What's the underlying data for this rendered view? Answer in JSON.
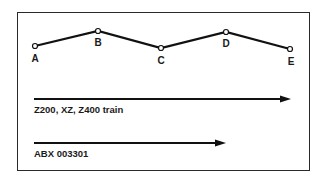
{
  "diagram": {
    "nodes": [
      {
        "id": "A",
        "label": "A",
        "x": 35,
        "y": 46
      },
      {
        "id": "B",
        "label": "B",
        "x": 98,
        "y": 31
      },
      {
        "id": "C",
        "label": "C",
        "x": 161,
        "y": 48
      },
      {
        "id": "D",
        "label": "D",
        "x": 226,
        "y": 32
      },
      {
        "id": "E",
        "label": "E",
        "x": 290,
        "y": 49
      }
    ],
    "routes": [
      {
        "label": "Z200, XZ, Z400 train",
        "from": "A",
        "to": "E"
      },
      {
        "label": "ABX 003301",
        "from": "A",
        "to": "D"
      }
    ]
  },
  "colors": {
    "line": "#111111",
    "border": "#2a2a2a",
    "background": "#ffffff"
  }
}
